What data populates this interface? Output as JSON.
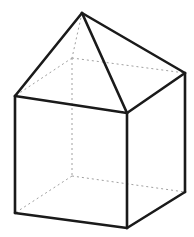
{
  "figure": {
    "background_color": "#ffffff",
    "visible_edge_color": "#1a1a1a",
    "hidden_edge_color": "#a0a0a0",
    "face_color": "#ffffff",
    "visible_edge_width": 2.6,
    "hidden_edge_width": 1,
    "hidden_dash_pattern": "2 3",
    "canvas": {
      "width": 194,
      "height": 237
    },
    "vertices": {
      "apex": {
        "label": "apex",
        "x": 82,
        "y": 13
      },
      "top_front_left": {
        "label": "top-front-left",
        "x": 15,
        "y": 96
      },
      "top_front_right": {
        "label": "top-front-right",
        "x": 127,
        "y": 113
      },
      "top_back_right": {
        "label": "top-back-right",
        "x": 185,
        "y": 73
      },
      "top_back_left": {
        "label": "top-back-left",
        "x": 72,
        "y": 58
      },
      "bottom_front_left": {
        "label": "bottom-front-left",
        "x": 15,
        "y": 213
      },
      "bottom_front_right": {
        "label": "bottom-front-right",
        "x": 127,
        "y": 228
      },
      "bottom_back_right": {
        "label": "bottom-back-right",
        "x": 185,
        "y": 192
      },
      "bottom_back_left": {
        "label": "bottom-back-left",
        "x": 72,
        "y": 176
      }
    },
    "faces": [
      {
        "name": "cube-front-left-face",
        "points": "15,96 127,113 127,228 15,213"
      },
      {
        "name": "cube-front-right-face",
        "points": "127,113 185,73 185,192 127,228"
      },
      {
        "name": "roof-left-face",
        "points": "82,13 15,96 127,113"
      },
      {
        "name": "roof-right-face",
        "points": "82,13 127,113 185,73"
      }
    ],
    "visible_edges": [
      {
        "name": "roof-edge-apex-to-top-front-left",
        "x1": 82,
        "y1": 13,
        "x2": 15,
        "y2": 96
      },
      {
        "name": "roof-edge-apex-to-top-front-right",
        "x1": 82,
        "y1": 13,
        "x2": 127,
        "y2": 113
      },
      {
        "name": "roof-edge-apex-to-top-back-right",
        "x1": 82,
        "y1": 13,
        "x2": 185,
        "y2": 73
      },
      {
        "name": "cube-top-edge-front-left",
        "x1": 15,
        "y1": 96,
        "x2": 127,
        "y2": 113
      },
      {
        "name": "cube-top-edge-front-right",
        "x1": 127,
        "y1": 113,
        "x2": 185,
        "y2": 73
      },
      {
        "name": "cube-vertical-edge-left",
        "x1": 15,
        "y1": 96,
        "x2": 15,
        "y2": 213
      },
      {
        "name": "cube-vertical-edge-front",
        "x1": 127,
        "y1": 113,
        "x2": 127,
        "y2": 228
      },
      {
        "name": "cube-vertical-edge-right",
        "x1": 185,
        "y1": 73,
        "x2": 185,
        "y2": 192
      },
      {
        "name": "cube-bottom-edge-front-left",
        "x1": 15,
        "y1": 213,
        "x2": 127,
        "y2": 228
      },
      {
        "name": "cube-bottom-edge-front-right",
        "x1": 127,
        "y1": 228,
        "x2": 185,
        "y2": 192
      }
    ],
    "hidden_edges": [
      {
        "name": "roof-hidden-edge-apex-to-top-back-left",
        "x1": 82,
        "y1": 13,
        "x2": 72,
        "y2": 58
      },
      {
        "name": "cube-hidden-top-edge-back-left",
        "x1": 72,
        "y1": 58,
        "x2": 15,
        "y2": 96
      },
      {
        "name": "cube-hidden-top-edge-back-right",
        "x1": 72,
        "y1": 58,
        "x2": 185,
        "y2": 73
      },
      {
        "name": "cube-hidden-vertical-edge-back",
        "x1": 72,
        "y1": 58,
        "x2": 72,
        "y2": 176
      },
      {
        "name": "cube-hidden-bottom-edge-back-left",
        "x1": 72,
        "y1": 176,
        "x2": 15,
        "y2": 213
      },
      {
        "name": "cube-hidden-bottom-edge-back-right",
        "x1": 72,
        "y1": 176,
        "x2": 185,
        "y2": 192
      }
    ]
  }
}
